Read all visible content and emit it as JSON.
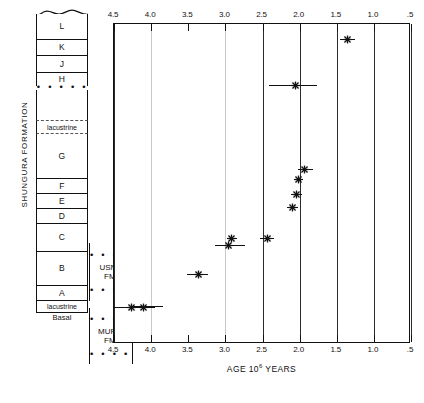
{
  "figure": {
    "axis_caption_main": "AGE 10",
    "axis_caption_exp": "6",
    "axis_caption_tail": " YEARS"
  },
  "stratigraphy": {
    "formation_label": "SHUNGURA FORMATION",
    "basal_label": "Basal",
    "units": [
      {
        "id": "L",
        "label": "L"
      },
      {
        "id": "K",
        "label": "K"
      },
      {
        "id": "J",
        "label": "J"
      },
      {
        "id": "H",
        "label": "H"
      },
      {
        "id": "tephra-dots-H",
        "label": "• • • • • • • • •"
      },
      {
        "id": "unnamed-upper",
        "label": ""
      },
      {
        "id": "lacustrine-upper",
        "label": "lacustrine"
      },
      {
        "id": "G",
        "label": "G"
      },
      {
        "id": "F",
        "label": "F"
      },
      {
        "id": "E",
        "label": "E"
      },
      {
        "id": "D",
        "label": "D"
      },
      {
        "id": "C",
        "label": "C"
      },
      {
        "id": "B",
        "label": "B"
      },
      {
        "id": "A",
        "label": "A"
      },
      {
        "id": "lacustrine-lower",
        "label": "lacustrine"
      }
    ],
    "satellite_formations": [
      {
        "id": "usno",
        "line1": "USNO",
        "line2": "FM.",
        "dots": "• • • • • • •"
      },
      {
        "id": "mursi",
        "line1": "MURSI",
        "line2": "FM.",
        "dots": "• • • • • • •"
      }
    ]
  },
  "chart_data": {
    "type": "scatter",
    "title": "",
    "xlabel": "AGE 10^6 YEARS",
    "ylabel": "",
    "xlim": [
      4.5,
      0.5
    ],
    "x_reversed": true,
    "grid": true,
    "legend": null,
    "tick_labels": [
      "4.5",
      "4.0",
      "3.5",
      "3.0",
      "2.5",
      "2.0",
      "1.5",
      "1.0",
      ".5"
    ],
    "tick_values": [
      4.5,
      4.0,
      3.5,
      3.0,
      2.5,
      2.0,
      1.5,
      1.0,
      0.5
    ],
    "gridline_values": [
      4.5,
      4.0,
      3.0,
      2.5,
      2.0,
      1.5,
      1.0,
      0.5
    ],
    "marker_symbol": "star",
    "points": [
      {
        "index": 1,
        "age": 1.35,
        "err_low": 1.45,
        "err_high": 1.26,
        "row": 1
      },
      {
        "index": 2,
        "age": 2.05,
        "err_low": 2.41,
        "err_high": 1.77,
        "row": 2
      },
      {
        "index": 3,
        "age": 1.93,
        "err_low": 2.02,
        "err_high": 1.82,
        "row": 3
      },
      {
        "index": 4,
        "age": 2.02,
        "err_low": 2.08,
        "err_high": 1.96,
        "row": 4
      },
      {
        "index": 5,
        "age": 2.04,
        "err_low": 2.11,
        "err_high": 1.97,
        "row": 5
      },
      {
        "index": 6,
        "age": 2.1,
        "err_low": 2.17,
        "err_high": 2.02,
        "row": 6
      },
      {
        "index": 7,
        "age": 2.43,
        "err_low": 2.53,
        "err_high": 2.34,
        "row": 7
      },
      {
        "index": 8,
        "age": 2.92,
        "err_low": 2.98,
        "err_high": 2.85,
        "row": 8
      },
      {
        "index": 9,
        "age": 2.96,
        "err_low": 3.14,
        "err_high": 2.74,
        "row": 9
      },
      {
        "index": 10,
        "age": 3.36,
        "err_low": 3.52,
        "err_high": 3.23,
        "row": 10
      },
      {
        "index": 11,
        "age": 4.26,
        "err_low": 4.5,
        "err_high": 4.1,
        "row": 11
      },
      {
        "index": 12,
        "age": 4.1,
        "err_low": 4.24,
        "err_high": 3.95,
        "row": 11
      }
    ]
  }
}
